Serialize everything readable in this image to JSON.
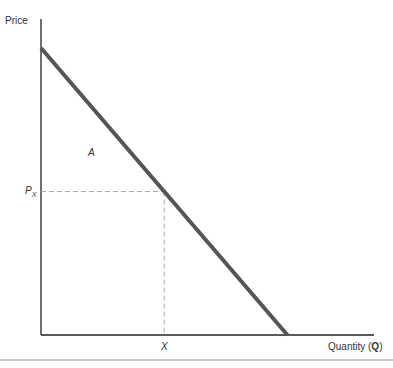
{
  "chart_data": {
    "type": "line",
    "title": "",
    "xlabel": "Quantity (",
    "xlabel_var": "Q",
    "xlabel_close": ")",
    "ylabel": "Price",
    "xlim": [
      0,
      1
    ],
    "ylim": [
      0,
      1
    ],
    "grid": false,
    "series": [
      {
        "name": "Demand",
        "color": "#555555",
        "points": [
          [
            0,
            1.0
          ],
          [
            0.74,
            0.0
          ]
        ]
      }
    ],
    "reference_point": {
      "x": 0.37,
      "y": 0.5
    },
    "annotations": {
      "region_label": "A",
      "price_label": "P",
      "price_label_sub": "X",
      "quantity_label": "X"
    },
    "colors": {
      "axis": "#222222",
      "dashed": "#aaaaaa",
      "rule": "#999999"
    }
  }
}
